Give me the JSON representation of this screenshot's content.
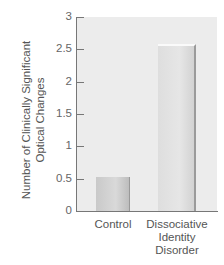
{
  "chart_data": {
    "type": "bar",
    "title": "",
    "xlabel": "",
    "ylabel": "Number of Clinically Significant Optical Changes",
    "categories": [
      "Control",
      "Dissociative Identity Disorder"
    ],
    "values": [
      0.53,
      2.55
    ],
    "ylim": [
      0,
      3
    ],
    "yticks": [
      "0",
      "0.5",
      "1",
      "1.5",
      "2",
      "2.5",
      "3"
    ],
    "grid": false,
    "legend": null
  },
  "labels": {
    "ylabel_line1": "Number of Clinically Significant",
    "ylabel_line2": "Optical Changes",
    "x0": "Control",
    "x1_line1": "Dissociative",
    "x1_line2": "Identity",
    "x1_line3": "Disorder"
  },
  "colors": {
    "plot_bg": "#ececec",
    "control_bar": "#cfcfcf",
    "did_bar": "#e2e2e2",
    "axis": "#777777"
  }
}
